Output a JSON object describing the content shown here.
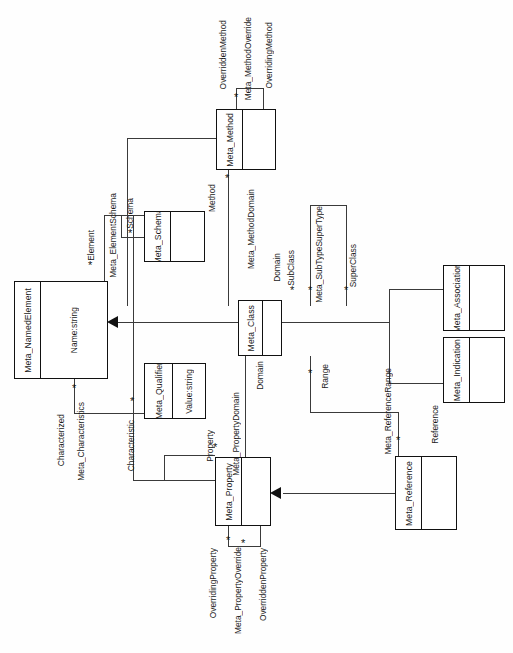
{
  "diagram": {
    "type": "uml-class-diagram",
    "orientation": "rotated-90-ccw",
    "classes": [
      {
        "id": "named_element",
        "name": "Meta_NamedElement",
        "attribute": "Name:string"
      },
      {
        "id": "schema",
        "name": "Meta_Schema",
        "attribute": ""
      },
      {
        "id": "method",
        "name": "Meta_Method",
        "attribute": ""
      },
      {
        "id": "class",
        "name": "Meta_Class",
        "attribute": ""
      },
      {
        "id": "qualifier",
        "name": "Meta_Qualifier",
        "attribute": "Value:string"
      },
      {
        "id": "property",
        "name": "Meta_Property",
        "attribute": ""
      },
      {
        "id": "association",
        "name": "Meta_Association",
        "attribute": ""
      },
      {
        "id": "indication",
        "name": "Meta_Indication",
        "attribute": ""
      },
      {
        "id": "reference",
        "name": "Meta_Reference",
        "attribute": ""
      }
    ],
    "associations": [
      {
        "id": "element_schema",
        "name": "Meta_ElementSchema",
        "end_a": "Element",
        "end_b": "Schema"
      },
      {
        "id": "method_override",
        "name": "Meta_MethodOverride",
        "end_a": "OverriddenMethod",
        "end_b": "OverridingMethod"
      },
      {
        "id": "method_domain",
        "name": "Meta_MethodDomain",
        "end_a": "Method",
        "end_b": "Domain"
      },
      {
        "id": "subtype_supertype",
        "name": "Meta_SubTypeSuperType",
        "end_a": "SubClass",
        "end_b": "SuperClass"
      },
      {
        "id": "characteristics",
        "name": "Meta_Characteristics",
        "end_a": "Characterized",
        "end_b": "Characteristic"
      },
      {
        "id": "property_domain",
        "name": "Meta_PropertyDomain",
        "end_a": "Property",
        "end_b": "Domain"
      },
      {
        "id": "property_override",
        "name": "Meta_PropertyOverride",
        "end_a": "OverridingProperty",
        "end_b": "OverriddenProperty"
      },
      {
        "id": "reference_range",
        "name": "Meta_ReferenceRange",
        "end_a": "Range",
        "end_b": "Reference"
      }
    ],
    "multiplicity_symbol": "*",
    "generalizations": [
      {
        "from": "Meta_Class",
        "to": "Meta_NamedElement"
      },
      {
        "from": "Meta_Association",
        "to": "Meta_NamedElement"
      },
      {
        "from": "Meta_Indication",
        "to": "Meta_NamedElement"
      },
      {
        "from": "Meta_Reference",
        "to": "Meta_Property"
      }
    ],
    "colors": {
      "line": "#3a3a3a",
      "border": "#111111",
      "text": "#1a1a1a",
      "background": "#fefefe"
    }
  }
}
